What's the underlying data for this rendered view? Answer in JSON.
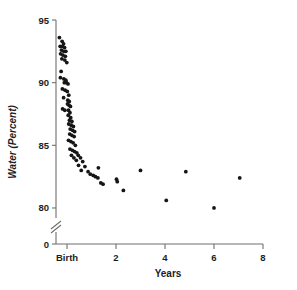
{
  "chart_data": {
    "type": "scatter",
    "title": "",
    "xlabel": "Years",
    "ylabel": "Water (Percent)",
    "xlim": [
      -0.45,
      8
    ],
    "ylim": [
      79.2,
      95
    ],
    "y_axis_break": true,
    "y_break_note": "axis broken between 80 and 0",
    "grid": false,
    "legend": null,
    "xticks": [
      {
        "value": 0,
        "label": "Birth"
      },
      {
        "value": 2,
        "label": "2"
      },
      {
        "value": 4,
        "label": "4"
      },
      {
        "value": 6,
        "label": "6"
      },
      {
        "value": 8,
        "label": "8"
      }
    ],
    "yticks": [
      {
        "value": 95,
        "label": "95"
      },
      {
        "value": 90,
        "label": "90"
      },
      {
        "value": 85,
        "label": "85"
      },
      {
        "value": 80,
        "label": "80"
      },
      {
        "value": 0,
        "label": "0"
      }
    ],
    "marker": {
      "shape": "circle",
      "size": 1.9,
      "color": "#151515"
    },
    "points": [
      {
        "x": -0.31,
        "y": 93.6
      },
      {
        "x": -0.2,
        "y": 93.3
      },
      {
        "x": -0.14,
        "y": 93.1
      },
      {
        "x": -0.28,
        "y": 92.9
      },
      {
        "x": -0.19,
        "y": 92.9
      },
      {
        "x": -0.1,
        "y": 92.8
      },
      {
        "x": -0.23,
        "y": 92.6
      },
      {
        "x": -0.13,
        "y": 92.5
      },
      {
        "x": -0.05,
        "y": 92.5
      },
      {
        "x": -0.26,
        "y": 92.3
      },
      {
        "x": -0.17,
        "y": 92.2
      },
      {
        "x": -0.07,
        "y": 92.1
      },
      {
        "x": -0.21,
        "y": 91.9
      },
      {
        "x": -0.09,
        "y": 91.8
      },
      {
        "x": -0.01,
        "y": 91.6
      },
      {
        "x": -0.24,
        "y": 90.9
      },
      {
        "x": -0.27,
        "y": 90.4
      },
      {
        "x": -0.13,
        "y": 90.3
      },
      {
        "x": -0.05,
        "y": 90.2
      },
      {
        "x": -0.11,
        "y": 90.0
      },
      {
        "x": -0.02,
        "y": 90.0
      },
      {
        "x": 0.04,
        "y": 89.9
      },
      {
        "x": -0.19,
        "y": 89.5
      },
      {
        "x": -0.08,
        "y": 89.4
      },
      {
        "x": 0.01,
        "y": 89.3
      },
      {
        "x": 0.07,
        "y": 89.0
      },
      {
        "x": -0.14,
        "y": 88.8
      },
      {
        "x": 0.03,
        "y": 88.6
      },
      {
        "x": 0.09,
        "y": 88.5
      },
      {
        "x": 0.02,
        "y": 88.3
      },
      {
        "x": 0.08,
        "y": 88.2
      },
      {
        "x": 0.14,
        "y": 88.1
      },
      {
        "x": -0.18,
        "y": 87.9
      },
      {
        "x": -0.09,
        "y": 87.8
      },
      {
        "x": 0.06,
        "y": 87.8
      },
      {
        "x": 0.12,
        "y": 87.6
      },
      {
        "x": 0.05,
        "y": 87.4
      },
      {
        "x": 0.15,
        "y": 87.2
      },
      {
        "x": 0.1,
        "y": 87.0
      },
      {
        "x": 0.2,
        "y": 86.9
      },
      {
        "x": 0.07,
        "y": 86.7
      },
      {
        "x": 0.17,
        "y": 86.6
      },
      {
        "x": 0.26,
        "y": 86.5
      },
      {
        "x": 0.13,
        "y": 86.3
      },
      {
        "x": 0.23,
        "y": 86.2
      },
      {
        "x": 0.31,
        "y": 86.1
      },
      {
        "x": 0.11,
        "y": 85.9
      },
      {
        "x": 0.2,
        "y": 85.8
      },
      {
        "x": 0.29,
        "y": 85.7
      },
      {
        "x": 0.06,
        "y": 85.4
      },
      {
        "x": 0.16,
        "y": 85.3
      },
      {
        "x": 0.25,
        "y": 85.2
      },
      {
        "x": 0.34,
        "y": 85.0
      },
      {
        "x": 0.12,
        "y": 84.7
      },
      {
        "x": 0.22,
        "y": 84.6
      },
      {
        "x": 0.31,
        "y": 84.5
      },
      {
        "x": 0.4,
        "y": 84.4
      },
      {
        "x": 0.18,
        "y": 84.2
      },
      {
        "x": 0.46,
        "y": 84.2
      },
      {
        "x": 0.28,
        "y": 84.0
      },
      {
        "x": 0.55,
        "y": 84.0
      },
      {
        "x": 0.38,
        "y": 83.8
      },
      {
        "x": 0.64,
        "y": 83.7
      },
      {
        "x": 0.47,
        "y": 83.4
      },
      {
        "x": 0.73,
        "y": 83.3
      },
      {
        "x": 0.58,
        "y": 83.0
      },
      {
        "x": 0.86,
        "y": 82.9
      },
      {
        "x": 0.95,
        "y": 82.7
      },
      {
        "x": 1.07,
        "y": 82.6
      },
      {
        "x": 1.16,
        "y": 82.5
      },
      {
        "x": 1.26,
        "y": 82.4
      },
      {
        "x": 1.38,
        "y": 82.0
      },
      {
        "x": 1.47,
        "y": 81.9
      },
      {
        "x": 2.02,
        "y": 82.3
      },
      {
        "x": 2.05,
        "y": 82.1
      },
      {
        "x": 2.3,
        "y": 81.4
      },
      {
        "x": 1.28,
        "y": 83.2
      },
      {
        "x": 3.0,
        "y": 83.0
      },
      {
        "x": 4.05,
        "y": 80.6
      },
      {
        "x": 4.85,
        "y": 82.9
      },
      {
        "x": 6.0,
        "y": 80.0
      },
      {
        "x": 7.05,
        "y": 82.4
      }
    ]
  }
}
